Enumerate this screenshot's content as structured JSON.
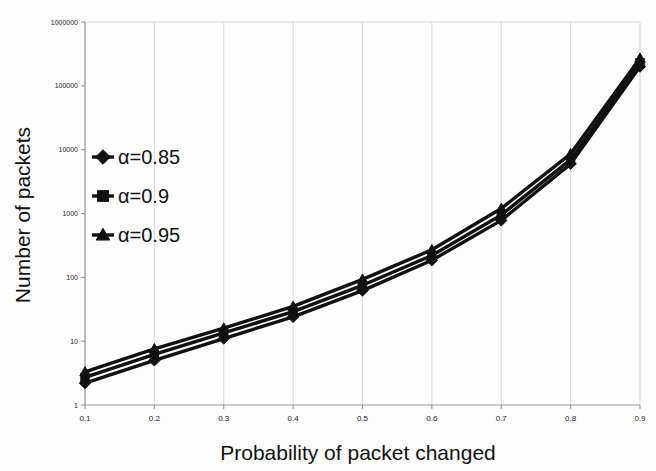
{
  "chart_data": {
    "type": "line",
    "title": "",
    "xlabel": "Probability of  packet  changed",
    "ylabel": "Number of packets",
    "x": [
      0.1,
      0.2,
      0.3,
      0.4,
      0.5,
      0.6,
      0.7,
      0.8,
      0.9
    ],
    "xtick_labels": [
      "0.1",
      "0.2",
      "0.3",
      "0.4",
      "0.5",
      "0.6",
      "0.7",
      "0.8",
      "0.9"
    ],
    "xlim": [
      0.1,
      0.9
    ],
    "ylim": [
      1,
      1000000
    ],
    "yscale": "log",
    "ytick_values": [
      1,
      10,
      100,
      1000,
      10000,
      100000,
      1000000
    ],
    "ytick_labels": [
      "1",
      "10",
      "100",
      "1000",
      "10000",
      "100000",
      "1000000"
    ],
    "grid": "vertical",
    "legend_position": "upper-left-inside",
    "series": [
      {
        "name": "α=0.85",
        "marker": "diamond",
        "color": "#111111",
        "values": [
          2.2,
          5.0,
          11.0,
          24.0,
          62.0,
          185.0,
          780.0,
          6000.0,
          200000.0
        ]
      },
      {
        "name": "α=0.9",
        "marker": "square",
        "color": "#111111",
        "values": [
          2.7,
          6.2,
          13.5,
          29.0,
          75.0,
          220.0,
          950.0,
          7000.0,
          230000.0
        ]
      },
      {
        "name": "α=0.95",
        "marker": "triangle",
        "color": "#111111",
        "values": [
          3.3,
          7.6,
          16.0,
          35.0,
          93.0,
          270.0,
          1200.0,
          8600.0,
          270000.0
        ]
      }
    ]
  },
  "legend": {
    "entries": [
      {
        "label": "α=0.85",
        "marker": "diamond"
      },
      {
        "label": "α=0.9",
        "marker": "square"
      },
      {
        "label": "α=0.95",
        "marker": "triangle"
      }
    ]
  },
  "axes": {
    "x_title": "Probability of  packet  changed",
    "y_title": "Number of packets"
  }
}
